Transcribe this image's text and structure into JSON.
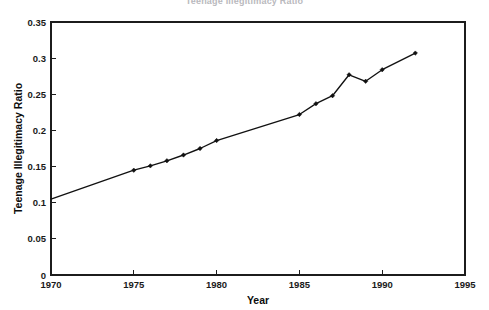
{
  "chart_data": {
    "type": "line",
    "title": "Teenage Illegitimacy Ratio",
    "xlabel": "Year",
    "ylabel": "Teenage Illegitimacy Ratio",
    "xlim": [
      1970,
      1995
    ],
    "ylim": [
      0,
      0.35
    ],
    "grid": false,
    "legend": false,
    "x_ticks": [
      1970,
      1975,
      1980,
      1985,
      1990,
      1995
    ],
    "x_tick_labels": [
      "1970",
      "1975",
      "1980",
      "1985",
      "1990",
      "1995"
    ],
    "y_ticks": [
      0,
      0.05,
      0.1,
      0.15,
      0.2,
      0.25,
      0.3,
      0.35
    ],
    "y_tick_labels": [
      "0",
      "0.05",
      "0.1",
      "0.15",
      "0.2",
      "0.25",
      "0.3",
      "0.35"
    ],
    "marker": "filled-diamond",
    "line_color": "#111111",
    "marker_color": "#111111",
    "x": [
      1970,
      1975,
      1976,
      1977,
      1978,
      1979,
      1980,
      1985,
      1986,
      1987,
      1988,
      1989,
      1990,
      1992
    ],
    "values": [
      0.105,
      0.145,
      0.151,
      0.158,
      0.166,
      0.175,
      0.186,
      0.222,
      0.237,
      0.248,
      0.277,
      0.268,
      0.284,
      0.307
    ],
    "series": [
      {
        "name": "Teenage Illegitimacy Ratio",
        "points": [
          {
            "year": 1970,
            "value": 0.105
          },
          {
            "year": 1975,
            "value": 0.145
          },
          {
            "year": 1976,
            "value": 0.151
          },
          {
            "year": 1977,
            "value": 0.158
          },
          {
            "year": 1978,
            "value": 0.166
          },
          {
            "year": 1979,
            "value": 0.175
          },
          {
            "year": 1980,
            "value": 0.186
          },
          {
            "year": 1985,
            "value": 0.222
          },
          {
            "year": 1986,
            "value": 0.237
          },
          {
            "year": 1987,
            "value": 0.248
          },
          {
            "year": 1988,
            "value": 0.277
          },
          {
            "year": 1989,
            "value": 0.268
          },
          {
            "year": 1990,
            "value": 0.284
          },
          {
            "year": 1992,
            "value": 0.307
          }
        ]
      }
    ]
  }
}
